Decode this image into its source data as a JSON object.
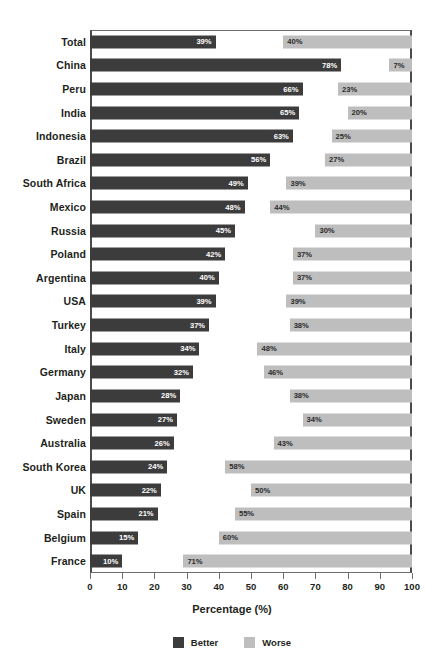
{
  "chart_data": {
    "type": "bar",
    "orientation": "horizontal",
    "title": "",
    "xlabel": "Percentage (%)",
    "ylabel": "",
    "xlim": [
      0,
      100
    ],
    "xticks": [
      0,
      10,
      20,
      30,
      40,
      50,
      60,
      70,
      80,
      90,
      100
    ],
    "grid": false,
    "legend_position": "bottom",
    "worse_series_alignment": "right-aligned-to-100",
    "categories": [
      "Total",
      "China",
      "Peru",
      "India",
      "Indonesia",
      "Brazil",
      "South Africa",
      "Mexico",
      "Russia",
      "Poland",
      "Argentina",
      "USA",
      "Turkey",
      "Italy",
      "Germany",
      "Japan",
      "Sweden",
      "Australia",
      "South Korea",
      "UK",
      "Spain",
      "Belgium",
      "France"
    ],
    "series": [
      {
        "name": "Better",
        "color": "#3c3c3c",
        "values": [
          39,
          78,
          66,
          65,
          63,
          56,
          49,
          48,
          45,
          42,
          40,
          39,
          37,
          34,
          32,
          28,
          27,
          26,
          24,
          22,
          21,
          15,
          10
        ],
        "labels": [
          "39%",
          "78%",
          "66%",
          "65%",
          "63%",
          "56%",
          "49%",
          "48%",
          "45%",
          "42%",
          "40%",
          "39%",
          "37%",
          "34%",
          "32%",
          "28%",
          "27%",
          "26%",
          "24%",
          "22%",
          "21%",
          "15%",
          "10%"
        ]
      },
      {
        "name": "Worse",
        "color": "#bebebe",
        "values": [
          40,
          7,
          23,
          20,
          25,
          27,
          39,
          44,
          30,
          37,
          37,
          39,
          38,
          48,
          46,
          38,
          34,
          43,
          58,
          50,
          55,
          60,
          71
        ],
        "labels": [
          "40%",
          "7%",
          "23%",
          "20%",
          "25%",
          "27%",
          "39%",
          "44%",
          "30%",
          "37%",
          "37%",
          "39%",
          "38%",
          "48%",
          "46%",
          "38%",
          "34%",
          "43%",
          "58%",
          "50%",
          "55%",
          "60%",
          "71%"
        ]
      }
    ],
    "legend": [
      {
        "label": "Better",
        "color": "#3c3c3c"
      },
      {
        "label": "Worse",
        "color": "#bebebe"
      }
    ]
  }
}
